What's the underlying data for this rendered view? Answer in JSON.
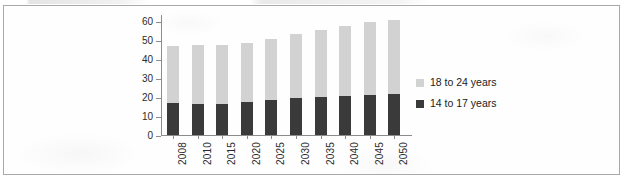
{
  "figure": {
    "frame_border_color": "#a9a9a9",
    "background_color": "#fefefe"
  },
  "legend": {
    "position": "right",
    "entries": [
      {
        "label": "18 to 24 years",
        "color": "#d2d2d2",
        "swatch_name": "legend-swatch-18-to-24"
      },
      {
        "label": "14 to 17 years",
        "color": "#3a3a3a",
        "swatch_name": "legend-swatch-14-to-17"
      }
    ]
  },
  "chart_data": {
    "type": "bar",
    "stacked": true,
    "title": "",
    "subtitle": "",
    "xlabel": "",
    "ylabel": "",
    "categories": [
      "2008",
      "2010",
      "2015",
      "2020",
      "2025",
      "2030",
      "2035",
      "2040",
      "2045",
      "2050"
    ],
    "series": [
      {
        "name": "14 to 17 years",
        "color": "#3a3a3a",
        "values": [
          17.0,
          16.5,
          16.5,
          17.5,
          18.5,
          19.5,
          20.0,
          21.0,
          21.5,
          22.0
        ]
      },
      {
        "name": "18 to 24 years",
        "color": "#d2d2d2",
        "values": [
          30.0,
          31.0,
          31.0,
          31.0,
          32.5,
          34.0,
          35.5,
          36.5,
          38.0,
          39.0
        ]
      }
    ],
    "totals": [
      47.0,
      47.5,
      47.5,
      48.5,
      51.0,
      53.5,
      55.5,
      57.5,
      59.5,
      61.0
    ],
    "ylim": [
      0,
      60
    ],
    "ytick_values": [
      0,
      10,
      20,
      30,
      40,
      50,
      60
    ],
    "ytick_labels": [
      "0",
      "10",
      "20",
      "30",
      "40",
      "50",
      "60"
    ],
    "grid": false,
    "xtick_rotation": 90,
    "legend_position": "right"
  }
}
